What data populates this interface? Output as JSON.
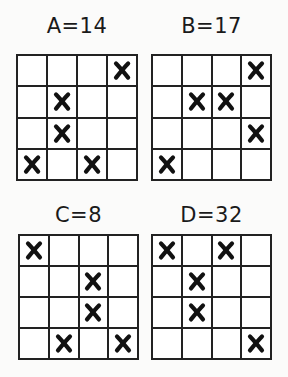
{
  "puzzles": [
    {
      "label": "A=14",
      "marks": [
        [
          0,
          0,
          0,
          1
        ],
        [
          0,
          1,
          0,
          0
        ],
        [
          0,
          1,
          0,
          0
        ],
        [
          1,
          0,
          1,
          0
        ]
      ]
    },
    {
      "label": "B=17",
      "marks": [
        [
          0,
          0,
          0,
          1
        ],
        [
          0,
          1,
          1,
          0
        ],
        [
          0,
          0,
          0,
          1
        ],
        [
          1,
          0,
          0,
          0
        ]
      ]
    },
    {
      "label": "C=8",
      "marks": [
        [
          1,
          0,
          0,
          0
        ],
        [
          0,
          0,
          1,
          0
        ],
        [
          0,
          0,
          1,
          0
        ],
        [
          0,
          1,
          0,
          1
        ]
      ]
    },
    {
      "label": "D=32",
      "marks": [
        [
          1,
          0,
          1,
          0
        ],
        [
          0,
          1,
          0,
          0
        ],
        [
          0,
          1,
          0,
          0
        ],
        [
          0,
          0,
          0,
          1
        ]
      ]
    }
  ],
  "mark_symbol": "x-mark-icon",
  "colors": {
    "line": "#222222",
    "mark": "#111111",
    "background": "#fbfbfa"
  }
}
